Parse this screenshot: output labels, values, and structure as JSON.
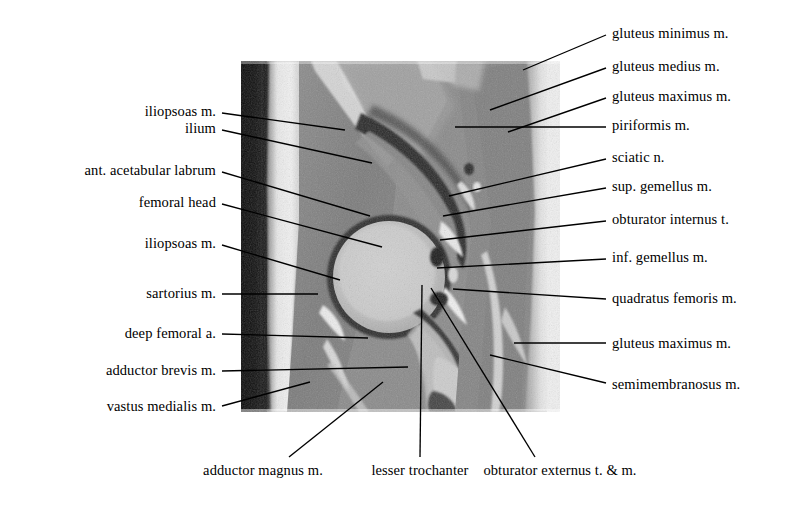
{
  "figure": {
    "image_name": "hip-mri-grayscale",
    "image_box": {
      "x": 241,
      "y": 61,
      "width": 319,
      "height": 351
    },
    "canvas": {
      "width": 785,
      "height": 513
    },
    "line_color": "#000000",
    "text_color": "#000000",
    "background_color": "#ffffff"
  },
  "labels_left": [
    {
      "id": "iliopsoas-m-upper",
      "text": "iliopsoas m.",
      "tx": 216,
      "ty": 111,
      "lx": 222,
      "ly": 113,
      "ex": 345,
      "ly2": 130
    },
    {
      "id": "ilium",
      "text": "ilium",
      "tx": 216,
      "ty": 128,
      "lx": 222,
      "ly": 130,
      "ex": 372,
      "ly2": 163
    },
    {
      "id": "ant-acetabular-labrum",
      "text": "ant. acetabular labrum",
      "tx": 216,
      "ty": 170,
      "lx": 222,
      "ly": 172,
      "ex": 370,
      "ly2": 216
    },
    {
      "id": "femoral-head",
      "text": "femoral head",
      "tx": 216,
      "ty": 202,
      "lx": 222,
      "ly": 204,
      "ex": 382,
      "ly2": 247
    },
    {
      "id": "iliopsoas-m-lower",
      "text": "iliopsoas m.",
      "tx": 216,
      "ty": 243,
      "lx": 222,
      "ly": 245,
      "ex": 340,
      "ly2": 280
    },
    {
      "id": "sartorius-m",
      "text": "sartorius m.",
      "tx": 216,
      "ty": 293,
      "lx": 222,
      "ly": 294,
      "ex": 318,
      "ly2": 294
    },
    {
      "id": "deep-femoral-a",
      "text": "deep femoral a.",
      "tx": 216,
      "ty": 333,
      "lx": 222,
      "ly": 334,
      "ex": 368,
      "ly2": 338
    },
    {
      "id": "adductor-brevis-m",
      "text": "adductor brevis m.",
      "tx": 216,
      "ty": 370,
      "lx": 222,
      "ly": 371,
      "ex": 408,
      "ly2": 367
    },
    {
      "id": "vastus-medialis-m",
      "text": "vastus medialis m.",
      "tx": 216,
      "ty": 406,
      "lx": 222,
      "ly": 406,
      "ex": 310,
      "ly2": 382
    }
  ],
  "labels_right": [
    {
      "id": "gluteus-minimus-m",
      "text": "gluteus minimus m.",
      "tx": 612,
      "ty": 33,
      "lx": 606,
      "ly": 35,
      "ex": 523,
      "ly2": 70
    },
    {
      "id": "gluteus-medius-m",
      "text": "gluteus medius m.",
      "tx": 612,
      "ty": 66,
      "lx": 606,
      "ly": 68,
      "ex": 490,
      "ly2": 110
    },
    {
      "id": "gluteus-maximus-m-1",
      "text": "gluteus maximus m.",
      "tx": 612,
      "ty": 96,
      "lx": 606,
      "ly": 98,
      "ex": 508,
      "ly2": 132
    },
    {
      "id": "piriformis-m",
      "text": "piriformis m.",
      "tx": 612,
      "ty": 125,
      "lx": 606,
      "ly": 127,
      "ex": 455,
      "ly2": 127
    },
    {
      "id": "sciatic-n",
      "text": "sciatic n.",
      "tx": 612,
      "ty": 157,
      "lx": 606,
      "ly": 159,
      "ex": 449,
      "ly2": 196
    },
    {
      "id": "sup-gemellus-m",
      "text": "sup. gemellus m.",
      "tx": 612,
      "ty": 186,
      "lx": 606,
      "ly": 188,
      "ex": 443,
      "ly2": 216
    },
    {
      "id": "obturator-internus-t",
      "text": "obturator internus t.",
      "tx": 612,
      "ty": 219,
      "lx": 606,
      "ly": 221,
      "ex": 440,
      "ly2": 240
    },
    {
      "id": "inf-gemellus-m",
      "text": "inf. gemellus m.",
      "tx": 612,
      "ty": 257,
      "lx": 606,
      "ly": 259,
      "ex": 437,
      "ly2": 268
    },
    {
      "id": "quadratus-femoris-m",
      "text": "quadratus femoris m.",
      "tx": 612,
      "ty": 298,
      "lx": 606,
      "ly": 299,
      "ex": 453,
      "ly2": 289
    },
    {
      "id": "gluteus-maximus-m-2",
      "text": "gluteus maximus m.",
      "tx": 612,
      "ty": 343,
      "lx": 606,
      "ly": 343,
      "ex": 514,
      "ly2": 343
    },
    {
      "id": "semimembranosus-m",
      "text": "semimembranosus m.",
      "tx": 612,
      "ty": 384,
      "lx": 606,
      "ly": 383,
      "ex": 490,
      "ly2": 355
    }
  ],
  "labels_bottom": [
    {
      "id": "adductor-magnus-m",
      "text": "adductor magnus m.",
      "tx": 263,
      "ty": 470,
      "lx": 289,
      "ly": 457,
      "ex": 383,
      "ly2": 382
    },
    {
      "id": "lesser-trochanter",
      "text": "lesser trochanter",
      "tx": 420,
      "ty": 470,
      "lx": 420,
      "ly": 457,
      "ex": 422,
      "ly2": 285
    },
    {
      "id": "obturator-externus-t-m",
      "text": "obturator externus t. & m.",
      "tx": 560,
      "ty": 470,
      "lx": 535,
      "ly": 457,
      "ex": 431,
      "ly2": 288
    }
  ]
}
